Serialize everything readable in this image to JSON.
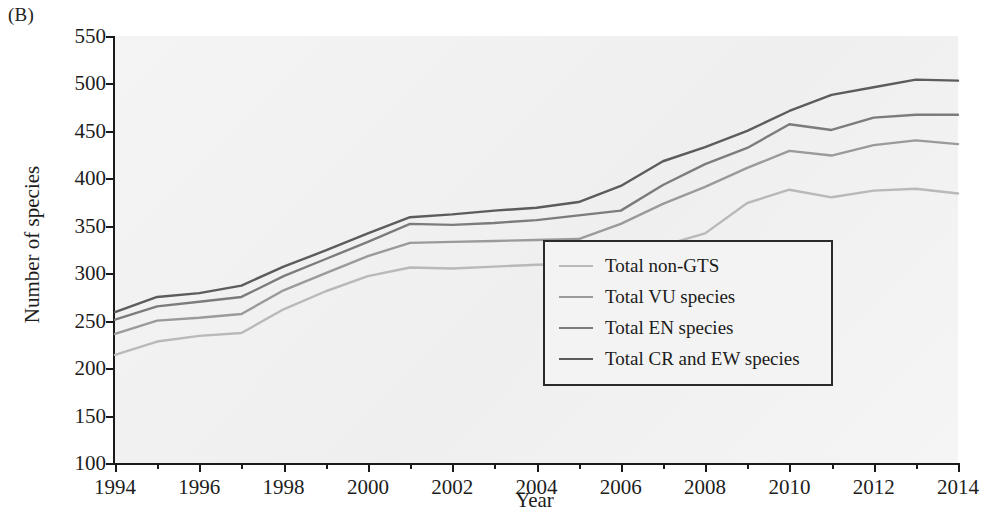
{
  "panel": {
    "label": "(B)"
  },
  "chart_data": {
    "type": "line",
    "title": "",
    "xlabel": "Year",
    "ylabel": "Number of species",
    "xlim": [
      1994,
      2014
    ],
    "ylim": [
      100,
      550
    ],
    "ytick_labels": [
      "550",
      "500",
      "450",
      "400",
      "350",
      "300",
      "250",
      "200",
      "150",
      "100"
    ],
    "yticks": [
      550,
      500,
      450,
      400,
      350,
      300,
      250,
      200,
      150,
      100
    ],
    "xtick_labels": [
      "1994",
      "1996",
      "1998",
      "2000",
      "2002",
      "2004",
      "2006",
      "2008",
      "2010",
      "2012",
      "2014"
    ],
    "xticks": [
      1994,
      1996,
      1998,
      2000,
      2002,
      2004,
      2006,
      2008,
      2010,
      2012,
      2014
    ],
    "minor_xticks": [
      1995,
      1997,
      1999,
      2001,
      2003,
      2005,
      2007,
      2009,
      2011,
      2013
    ],
    "grid": false,
    "legend_position": "lower right",
    "x": [
      1994,
      1995,
      1996,
      1997,
      1998,
      1999,
      2000,
      2001,
      2002,
      2003,
      2004,
      2005,
      2006,
      2007,
      2008,
      2009,
      2010,
      2011,
      2012,
      2013,
      2014
    ],
    "series": [
      {
        "name": "Total non-GTS",
        "color": "#b9b9b9",
        "values": [
          214,
          228,
          234,
          237,
          262,
          281,
          297,
          306,
          305,
          307,
          309,
          310,
          317,
          329,
          342,
          374,
          388,
          380,
          387,
          389,
          384
        ]
      },
      {
        "name": "Total VU species",
        "color": "#9a9a9a",
        "values": [
          236,
          250,
          253,
          257,
          282,
          300,
          318,
          332,
          333,
          334,
          335,
          336,
          352,
          373,
          391,
          411,
          429,
          424,
          435,
          440,
          436
        ]
      },
      {
        "name": "Total EN species",
        "color": "#7c7c7c",
        "values": [
          251,
          265,
          270,
          275,
          297,
          315,
          333,
          352,
          351,
          353,
          356,
          361,
          366,
          393,
          415,
          432,
          457,
          451,
          464,
          467,
          467
        ]
      },
      {
        "name": "Total CR and EW species",
        "color": "#5c5c5c",
        "values": [
          259,
          275,
          279,
          287,
          307,
          324,
          342,
          359,
          362,
          366,
          369,
          375,
          392,
          418,
          433,
          450,
          471,
          488,
          496,
          504,
          503
        ]
      }
    ]
  },
  "legend": {
    "items": [
      {
        "label": "Total non-GTS"
      },
      {
        "label": "Total VU species"
      },
      {
        "label": "Total EN species"
      },
      {
        "label": "Total CR and EW species"
      }
    ]
  }
}
